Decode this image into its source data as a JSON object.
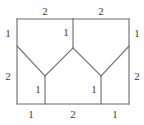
{
  "figure": {
    "kind": "squared-rectangle-dissection",
    "stroke_color": "#6b6b6b",
    "label_color": "#3b3b3b",
    "background_color": "#ffffff",
    "stroke_width": 1.1,
    "rect": {
      "left": 17,
      "top": 19,
      "right": 129,
      "bottom": 104
    },
    "vertices": {
      "top_left": {
        "x": 17,
        "y": 19
      },
      "top_mid": {
        "x": 73,
        "y": 19
      },
      "top_right": {
        "x": 129,
        "y": 19
      },
      "left_diag_start": {
        "x": 17,
        "y": 46
      },
      "right_diag_start": {
        "x": 129,
        "y": 46
      },
      "apex": {
        "x": 73,
        "y": 48
      },
      "left_valley": {
        "x": 45,
        "y": 76
      },
      "right_valley": {
        "x": 101,
        "y": 76
      },
      "bottom_left": {
        "x": 17,
        "y": 104
      },
      "bottom_left_foot": {
        "x": 45,
        "y": 104
      },
      "bottom_right_foot": {
        "x": 101,
        "y": 104
      },
      "bottom_right": {
        "x": 129,
        "y": 104
      }
    },
    "segments": [
      {
        "name": "rect-top-left-half",
        "x1": 17,
        "y1": 19,
        "x2": 73,
        "y2": 19
      },
      {
        "name": "rect-top-right-half",
        "x1": 73,
        "y1": 19,
        "x2": 129,
        "y2": 19
      },
      {
        "name": "rect-left-edge",
        "x1": 17,
        "y1": 19,
        "x2": 17,
        "y2": 104
      },
      {
        "name": "rect-right-edge",
        "x1": 129,
        "y1": 19,
        "x2": 129,
        "y2": 104
      },
      {
        "name": "rect-bottom-edge",
        "x1": 17,
        "y1": 104,
        "x2": 129,
        "y2": 104
      },
      {
        "name": "center-vertical-top",
        "x1": 73,
        "y1": 19,
        "x2": 73,
        "y2": 48
      },
      {
        "name": "diagonal-upper-left",
        "x1": 17,
        "y1": 46,
        "x2": 45,
        "y2": 76
      },
      {
        "name": "diagonal-upper-right",
        "x1": 129,
        "y1": 46,
        "x2": 101,
        "y2": 76
      },
      {
        "name": "diagonal-inner-left",
        "x1": 45,
        "y1": 76,
        "x2": 73,
        "y2": 48
      },
      {
        "name": "diagonal-inner-right",
        "x1": 73,
        "y1": 48,
        "x2": 101,
        "y2": 76
      },
      {
        "name": "vertical-left-lower",
        "x1": 45,
        "y1": 76,
        "x2": 45,
        "y2": 104
      },
      {
        "name": "vertical-right-lower",
        "x1": 101,
        "y1": 76,
        "x2": 101,
        "y2": 104
      }
    ],
    "labels": [
      {
        "name": "label-top-left",
        "text": "2",
        "x": 45,
        "y": 11
      },
      {
        "name": "label-top-right",
        "text": "2",
        "x": 101,
        "y": 11
      },
      {
        "name": "label-left-upper",
        "text": "1",
        "x": 8,
        "y": 33
      },
      {
        "name": "label-left-lower",
        "text": "2",
        "x": 8,
        "y": 76
      },
      {
        "name": "label-right-upper",
        "text": "1",
        "x": 137,
        "y": 33
      },
      {
        "name": "label-right-lower",
        "text": "2",
        "x": 137,
        "y": 76
      },
      {
        "name": "label-center-vertical",
        "text": "1",
        "x": 66,
        "y": 32
      },
      {
        "name": "label-left-vertical",
        "text": "1",
        "x": 38,
        "y": 89
      },
      {
        "name": "label-right-vertical",
        "text": "1",
        "x": 94,
        "y": 89
      },
      {
        "name": "label-bottom-left",
        "text": "1",
        "x": 31,
        "y": 114
      },
      {
        "name": "label-bottom-middle",
        "text": "2",
        "x": 73,
        "y": 114
      },
      {
        "name": "label-bottom-right",
        "text": "1",
        "x": 115,
        "y": 114
      }
    ]
  }
}
